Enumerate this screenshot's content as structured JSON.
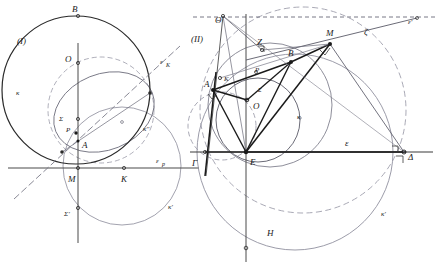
{
  "figure": {
    "title_visible": false,
    "width": 439,
    "height": 265,
    "background": "#ffffff",
    "stroke_dark": "#2a2a2a",
    "stroke_mid": "#555555",
    "stroke_light": "#8a8a99"
  },
  "panels": [
    {
      "tag": "(I)",
      "tag_x": 22,
      "tag_y": 40,
      "labels": [
        {
          "text": "B",
          "x": 74,
          "y": 15,
          "size": 9
        },
        {
          "text": "O",
          "x": 72,
          "y": 59,
          "size": 9
        },
        {
          "text": "κ",
          "x": 22,
          "y": 92,
          "size": 8
        },
        {
          "text": "Σ",
          "x": 63,
          "y": 118,
          "size": 8
        },
        {
          "text": "P",
          "x": 70,
          "y": 131,
          "size": 8
        },
        {
          "text": "A",
          "x": 80,
          "y": 146,
          "size": 9
        },
        {
          "text": "M",
          "x": 70,
          "y": 178,
          "size": 9
        },
        {
          "text": "K",
          "x": 126,
          "y": 178,
          "size": 9
        },
        {
          "text": "Σ'",
          "x": 68,
          "y": 213,
          "size": 8
        },
        {
          "text": "ε",
          "x": 164,
          "y": 60,
          "size": 8
        },
        {
          "text": "K",
          "x": 170,
          "y": 65,
          "size": 6
        },
        {
          "text": "κ''",
          "x": 148,
          "y": 128,
          "size": 8
        },
        {
          "text": "ε",
          "x": 158,
          "y": 160,
          "size": 8
        },
        {
          "text": "p",
          "x": 164,
          "y": 164,
          "size": 6
        },
        {
          "text": "κ'",
          "x": 172,
          "y": 206,
          "size": 8
        }
      ]
    },
    {
      "tag": "(II)",
      "tag_x": 196,
      "tag_y": 38,
      "labels": [
        {
          "text": "Θ",
          "x": 222,
          "y": 20,
          "size": 9
        },
        {
          "text": "Z",
          "x": 261,
          "y": 45,
          "size": 9
        },
        {
          "text": "B",
          "x": 293,
          "y": 52,
          "size": 9
        },
        {
          "text": "M",
          "x": 329,
          "y": 34,
          "size": 9
        },
        {
          "text": "ζ",
          "x": 367,
          "y": 33,
          "size": 9
        },
        {
          "text": "ε'",
          "x": 411,
          "y": 22,
          "size": 8
        },
        {
          "text": "P",
          "x": 260,
          "y": 70,
          "size": 8
        },
        {
          "text": "K",
          "x": 228,
          "y": 79,
          "size": 8
        },
        {
          "text": "A",
          "x": 210,
          "y": 84,
          "size": 9
        },
        {
          "text": "Σ",
          "x": 262,
          "y": 89,
          "size": 7
        },
        {
          "text": "O",
          "x": 259,
          "y": 105,
          "size": 9
        },
        {
          "text": "κ",
          "x": 300,
          "y": 116,
          "size": 8
        },
        {
          "text": "Γ",
          "x": 194,
          "y": 164,
          "size": 9
        },
        {
          "text": "E",
          "x": 248,
          "y": 163,
          "size": 9
        },
        {
          "text": "ε",
          "x": 349,
          "y": 141,
          "size": 9
        },
        {
          "text": "Δ",
          "x": 410,
          "y": 158,
          "size": 9
        },
        {
          "text": "H",
          "x": 271,
          "y": 233,
          "size": 9
        },
        {
          "text": "κ'",
          "x": 385,
          "y": 213,
          "size": 8
        }
      ]
    }
  ],
  "geometry": {
    "panel1": {
      "circle_kappa": {
        "cx": 75,
        "cy": 90,
        "r": 75,
        "style": "solid-dark"
      },
      "circle_kappa_dprime": {
        "cx": 100,
        "cy": 110,
        "r": 53,
        "style": "dashed-light"
      },
      "circle_kappa_prime": {
        "cx": 120,
        "cy": 163,
        "r": 58,
        "style": "solid-light"
      },
      "line_vertical": {
        "x1": 78,
        "y1": 42,
        "x2": 78,
        "y2": 240
      },
      "line_horizontal_ep": {
        "x1": 8,
        "y1": 168,
        "x2": 198,
        "y2": 168
      },
      "line_ek": {
        "x1": 16,
        "y1": 196,
        "x2": 178,
        "y2": 48
      }
    },
    "panel2": {
      "circle_kappa": {
        "cx": 258,
        "cy": 118,
        "r": 45,
        "style": "solid-mid"
      },
      "circle_big": {
        "cx": 300,
        "cy": 110,
        "r": 110,
        "style": "dashed-light"
      },
      "circle_kappa_prime": {
        "cx": 293,
        "cy": 150,
        "r": 95,
        "style": "solid-light"
      },
      "circle_left_small": {
        "cx": 222,
        "cy": 125,
        "r": 38,
        "style": "dashed-light"
      },
      "line_epsilon": {
        "x1": 190,
        "y1": 152,
        "x2": 432,
        "y2": 152
      },
      "line_epsilon_prime": {
        "x1": 196,
        "y1": 17,
        "x2": 436,
        "y2": 17,
        "style": "dashed"
      },
      "line_vertical": {
        "x1": 246,
        "y1": 14,
        "x2": 246,
        "y2": 260
      },
      "line_zeta": {
        "x1": 300,
        "y1": 47,
        "x2": 418,
        "y2": 17
      }
    }
  }
}
